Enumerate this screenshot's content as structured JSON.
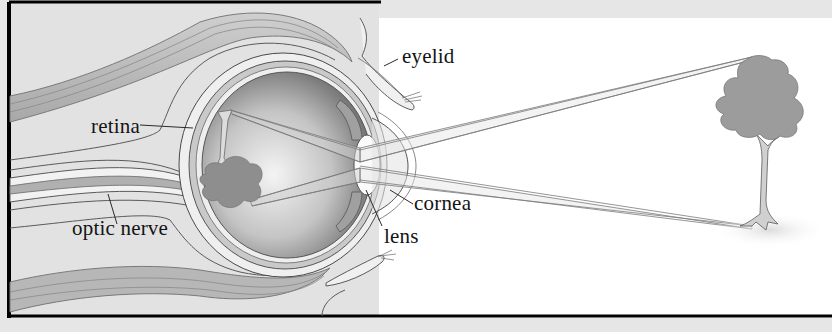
{
  "diagram": {
    "labels": {
      "eyelid": "eyelid",
      "retina": "retina",
      "cornea": "cornea",
      "lens": "lens",
      "optic_nerve": "optic nerve"
    },
    "objects": {
      "eye": "eyeball-cross-section",
      "tree": "tree-object",
      "retinal_image": "inverted-tree-image",
      "light_rays": "light-rays-through-lens"
    },
    "colors": {
      "background_panel": "#ffffff",
      "outer_background": "#e6e6e6",
      "frame_border": "#000000",
      "tissue": "#d9d9d9",
      "eyeball_dark": "#8a8a8a",
      "foliage": "#9a9a9a",
      "label_text": "#141414"
    }
  }
}
